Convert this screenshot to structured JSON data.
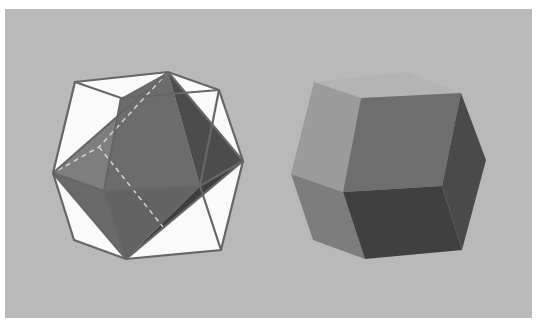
{
  "figure": {
    "background_color": "#b9b9b9",
    "page_color": "#ffffff",
    "left_solid": {
      "name": "octahedron-in-cube",
      "frame_color": "#6a6a6a",
      "frame_face_color": "#fafafa",
      "face_colors": [
        "#8a8a8a",
        "#5e5e5e",
        "#707070",
        "#4a4a4a",
        "#7c7c7c",
        "#3e3e3e"
      ],
      "hidden_edge_color": "#cfcfcf"
    },
    "right_solid": {
      "name": "rhombic-dodecahedron",
      "face_colors": [
        "#b3b3b3",
        "#9a9a9a",
        "#6e6e6e",
        "#505050",
        "#7d7d7d",
        "#454545",
        "#3a3a3a"
      ]
    }
  }
}
